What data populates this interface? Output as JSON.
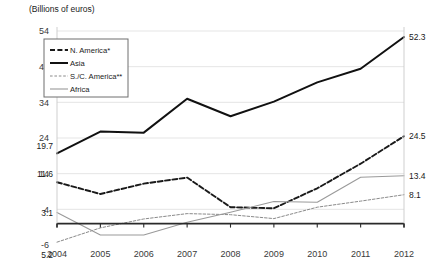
{
  "chart_data": {
    "type": "line",
    "title": "(Billions of euros)",
    "ylabel": "",
    "xlabel": "",
    "grid": true,
    "legend_position": "top-left-inset",
    "x": [
      "2004",
      "2005",
      "2006",
      "2007",
      "2008",
      "2009",
      "2010",
      "2011",
      "2012"
    ],
    "ylim": [
      -6,
      54
    ],
    "yticks": [
      "-6",
      "4",
      "14",
      "24",
      "34",
      "44",
      "54"
    ],
    "series": [
      {
        "name": "N. America*",
        "style": "dashed-bold",
        "color": "#1a1a1a",
        "values": [
          11.6,
          8.3,
          11.2,
          12.9,
          4.6,
          4.3,
          9.9,
          16.8,
          24.5
        ],
        "start_label": "11.6",
        "end_label": "24.5"
      },
      {
        "name": "Asia",
        "style": "solid-bold",
        "color": "#111111",
        "values": [
          19.7,
          25.8,
          25.5,
          35.0,
          30.1,
          34.2,
          39.6,
          43.4,
          52.3
        ],
        "start_label": "19.7",
        "end_label": "52.3"
      },
      {
        "name": "S./C. America**",
        "style": "dotted-thin",
        "color": "#8a8a8a",
        "values": [
          -5.2,
          -1.2,
          1.3,
          2.8,
          2.5,
          1.4,
          4.6,
          6.3,
          8.1
        ],
        "start_label": "5.2",
        "end_label": "8.1"
      },
      {
        "name": "Africa",
        "style": "solid-thin",
        "color": "#9a9a9a",
        "values": [
          3.1,
          -3.2,
          -3.2,
          0.4,
          3.2,
          6.2,
          6.0,
          13.0,
          13.4
        ],
        "start_label": "3.1",
        "end_label": "13.4"
      }
    ],
    "legend": [
      {
        "label": "N. America*",
        "style": "dashed-bold"
      },
      {
        "label": "Asia",
        "style": "solid-bold"
      },
      {
        "label": "S./C. America**",
        "style": "dotted-thin"
      },
      {
        "label": "Africa",
        "style": "solid-thin"
      }
    ]
  }
}
